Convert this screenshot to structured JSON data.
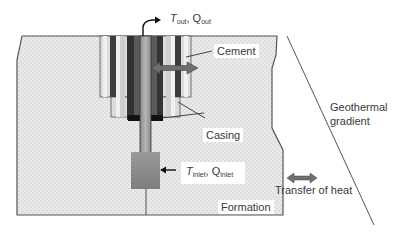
{
  "diagram": {
    "labels": {
      "outlet": {
        "T": "T",
        "T_sub": "out",
        "sep": ", ",
        "Q": "Q",
        "Q_sub": "out"
      },
      "inlet": {
        "T": "T",
        "T_sub": "inlet",
        "sep": ", ",
        "Q": "Q",
        "Q_sub": "inlet"
      },
      "cement": "Cement",
      "casing": "Casing",
      "formation": "Formation",
      "geothermal_gradient_line1": "Geothermal",
      "geothermal_gradient_line2": "gradient",
      "transfer_of_heat": "Transfer of heat"
    },
    "colors": {
      "formation_fill": "#e9e9e9",
      "formation_dot": "#cfcfcf",
      "outline": "#555555",
      "casing_dark": "#3c3c3c",
      "casing_mid": "#6e6e6e",
      "cement_light": "#d8d8d8",
      "tubing": "#9a9a9a",
      "bottom_hole": "#8c8c8c",
      "arrow_fill": "#707070",
      "text": "#3a3a3a"
    }
  }
}
